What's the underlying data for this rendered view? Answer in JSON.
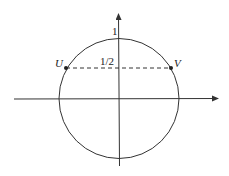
{
  "diagram": {
    "type": "unit-circle",
    "labels": {
      "top": "1",
      "chord": "1/2",
      "left_point": "U",
      "right_point": "V"
    },
    "colors": {
      "stroke": "#333333",
      "background": "#ffffff"
    }
  }
}
